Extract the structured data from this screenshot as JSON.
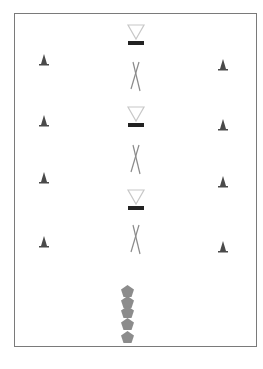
{
  "diagram": {
    "type": "drill-layout",
    "field": {
      "x": 14,
      "y": 13,
      "width": 243,
      "height": 334,
      "border_color": "#7a7a7a"
    },
    "cones_left": [
      {
        "x": 44,
        "y": 60
      },
      {
        "x": 44,
        "y": 121
      },
      {
        "x": 44,
        "y": 178
      },
      {
        "x": 44,
        "y": 242
      }
    ],
    "cones_right": [
      {
        "x": 223,
        "y": 65
      },
      {
        "x": 223,
        "y": 125
      },
      {
        "x": 223,
        "y": 182
      },
      {
        "x": 223,
        "y": 247
      }
    ],
    "goal_markers": [
      {
        "x": 136,
        "y": 35
      },
      {
        "x": 136,
        "y": 117
      },
      {
        "x": 136,
        "y": 200
      }
    ],
    "crossed_poles": [
      {
        "x": 136,
        "y": 77
      },
      {
        "x": 136,
        "y": 160
      },
      {
        "x": 136,
        "y": 240
      }
    ],
    "players": [
      {
        "x": 127,
        "y": 291
      },
      {
        "x": 127,
        "y": 302
      },
      {
        "x": 127,
        "y": 312
      },
      {
        "x": 127,
        "y": 324
      },
      {
        "x": 127,
        "y": 337
      }
    ],
    "colors": {
      "cone": "#4a4a4a",
      "triangle": "#c8c8c8",
      "bar": "#222222",
      "pole": "#8a8a8a",
      "player": "#8c8c8c"
    }
  }
}
